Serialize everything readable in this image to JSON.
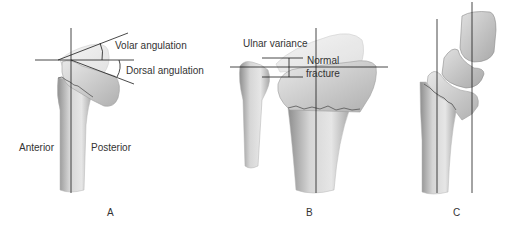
{
  "figure": {
    "panels": [
      {
        "id": "A",
        "label": "A",
        "annotations": {
          "volar": "Volar angulation",
          "dorsal": "Dorsal angulation",
          "anterior": "Anterior",
          "posterior": "Posterior"
        }
      },
      {
        "id": "B",
        "label": "B",
        "annotations": {
          "ulnar_variance": "Ulnar variance",
          "normal": "Normal",
          "fracture": "fracture"
        }
      },
      {
        "id": "C",
        "label": "C",
        "annotations": {}
      }
    ],
    "colors": {
      "background": "#ffffff",
      "bone_fill": "#cfcfcf",
      "bone_dark": "#9a9a9a",
      "bone_light": "#ececec",
      "ghost_fill": "#e4e4e4",
      "line": "#1a1a1a",
      "text": "#333333"
    }
  }
}
